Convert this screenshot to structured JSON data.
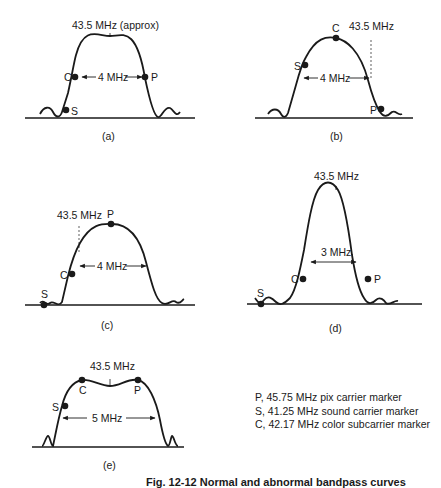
{
  "figure": {
    "caption": "Fig. 12-12  Normal and abnormal bandpass curves",
    "colors": {
      "ink": "#1a1a1a",
      "background": "#ffffff"
    }
  },
  "panels": [
    {
      "id": "a",
      "label": "(a)",
      "center_label": "43.5 MHz (approx)",
      "width_label": "4 MHz",
      "markers": [
        "C",
        "P",
        "S"
      ]
    },
    {
      "id": "b",
      "label": "(b)",
      "center_label": "43.5 MHz",
      "width_label": "4 MHz",
      "markers": [
        "C",
        "S",
        "P"
      ]
    },
    {
      "id": "c",
      "label": "(c)",
      "center_label": "43.5 MHz",
      "width_label": "4 MHz",
      "markers": [
        "P",
        "C",
        "S"
      ]
    },
    {
      "id": "d",
      "label": "(d)",
      "center_label": "43.5 MHz",
      "width_label": "3 MHz",
      "markers": [
        "C",
        "P",
        "S"
      ]
    },
    {
      "id": "e",
      "label": "(e)",
      "center_label": "43.5 MHz",
      "width_label": "5 MHz",
      "markers": [
        "C",
        "P",
        "S"
      ]
    }
  ],
  "legend": [
    "P, 45.75 MHz pix carrier marker",
    "S, 41.25 MHz sound carrier marker",
    "C, 42.17 MHz color subcarrier marker"
  ]
}
